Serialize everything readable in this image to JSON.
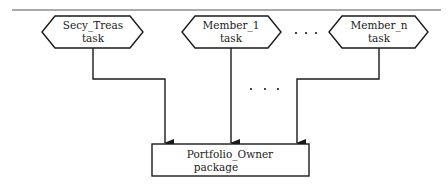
{
  "diagram": {
    "type": "structure-chart",
    "tasks": [
      {
        "id": "secy_treas",
        "line1": "Secy_Treas",
        "line2": "task"
      },
      {
        "id": "member_1",
        "line1": "Member_1",
        "line2": "task"
      },
      {
        "id": "member_n",
        "line1": "Member_n",
        "line2": "task"
      }
    ],
    "ellipsis_between_tasks": "· · ·",
    "ellipsis_between_arrows": "· · ·",
    "package": {
      "id": "portfolio_owner",
      "line1": "Portfolio_Owner",
      "line2": "package"
    },
    "edges": [
      {
        "from": "secy_treas",
        "to": "portfolio_owner"
      },
      {
        "from": "member_1",
        "to": "portfolio_owner"
      },
      {
        "from": "member_n",
        "to": "portfolio_owner"
      }
    ],
    "colors": {
      "stroke": "#1a1a1a",
      "background": "#ffffff",
      "rule": "#555555"
    }
  }
}
